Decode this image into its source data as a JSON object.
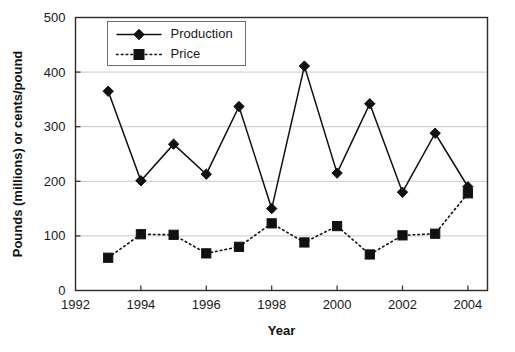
{
  "chart_data": {
    "type": "line",
    "title": "",
    "xlabel": "Year",
    "ylabel": "Pounds (millions) or cents/pound",
    "x": [
      1993,
      1994,
      1995,
      1996,
      1997,
      1998,
      1999,
      2000,
      2001,
      2002,
      2003,
      2004
    ],
    "xlim": [
      1992,
      2004.6
    ],
    "ylim": [
      0,
      500
    ],
    "x_tick_labels": [
      "1992",
      "1994",
      "1996",
      "1998",
      "2000",
      "2002",
      "2004"
    ],
    "x_ticks": [
      1992,
      1994,
      1996,
      1998,
      2000,
      2002,
      2004
    ],
    "y_tick_labels": [
      "0",
      "100",
      "200",
      "300",
      "400",
      "500"
    ],
    "y_ticks": [
      0,
      100,
      200,
      300,
      400,
      500
    ],
    "grid": "horizontal",
    "legend_position": "top-left-inside",
    "series": [
      {
        "name": "Production",
        "marker": "diamond",
        "line_style": "solid",
        "color": "#111111",
        "values": [
          365,
          201,
          268,
          213,
          337,
          150,
          411,
          215,
          342,
          180,
          288,
          190
        ]
      },
      {
        "name": "Price",
        "marker": "square",
        "line_style": "dotted",
        "color": "#111111",
        "values": [
          60,
          103,
          102,
          68,
          80,
          123,
          88,
          118,
          66,
          101,
          104,
          178
        ]
      }
    ]
  },
  "legend": {
    "items": [
      {
        "label": "Production"
      },
      {
        "label": "Price"
      }
    ]
  },
  "axes": {
    "x_title": "Year",
    "y_title": "Pounds (millions) or cents/pound"
  }
}
